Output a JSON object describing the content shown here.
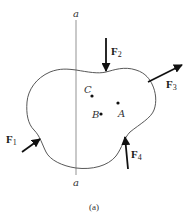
{
  "figure": {
    "caption": "(a)",
    "colors": {
      "background": "#ffffff",
      "outline": "#444444",
      "arrow": "#111111",
      "text": "#222222"
    }
  },
  "axis": {
    "name": "a-a",
    "top_label": "a",
    "bottom_label": "a"
  },
  "points": [
    {
      "id": "C",
      "label": "C"
    },
    {
      "id": "A",
      "label": "A"
    },
    {
      "id": "B",
      "label": "B"
    }
  ],
  "forces": [
    {
      "id": "F1",
      "symbol": "F",
      "subscript": "1",
      "direction": "up-right, into body at lower-left"
    },
    {
      "id": "F2",
      "symbol": "F",
      "subscript": "2",
      "direction": "down, onto top of body"
    },
    {
      "id": "F3",
      "symbol": "F",
      "subscript": "3",
      "direction": "up-right, away from right side"
    },
    {
      "id": "F4",
      "symbol": "F",
      "subscript": "4",
      "direction": "up, into lower-right of body"
    }
  ]
}
